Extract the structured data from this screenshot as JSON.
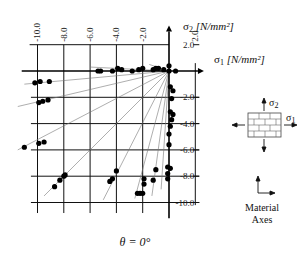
{
  "chart_data": {
    "type": "scatter",
    "title": "θ = 0°",
    "xlabel": "σ1 [N/mm²]",
    "ylabel": "σ2 [N/mm²]",
    "xlim": [
      -10.0,
      2.0
    ],
    "ylim": [
      -10.0,
      2.0
    ],
    "x_ticks": [
      "-10.0",
      "-8.0",
      "-6.0",
      "-4.0",
      "-2.0",
      "2.0"
    ],
    "y_ticks": [
      "2.0",
      "-2.0",
      "-4.0",
      "-6.0",
      "-8.0",
      "-10.0"
    ],
    "grid": true,
    "legend": {
      "position": "right",
      "stress_arrows": [
        "σ2",
        "σ1"
      ],
      "caption": [
        "Material",
        "Axes"
      ]
    },
    "series": [
      {
        "name": "experimental failure points",
        "points": [
          [
            -10.2,
            -0.9
          ],
          [
            -9.8,
            -0.8
          ],
          [
            -9.1,
            -0.8
          ],
          [
            -9.9,
            -2.4
          ],
          [
            -9.6,
            -2.3
          ],
          [
            -9.2,
            -2.2
          ],
          [
            -11.0,
            -5.8
          ],
          [
            -9.9,
            -5.5
          ],
          [
            -9.5,
            -5.4
          ],
          [
            -8.7,
            -8.8
          ],
          [
            -8.3,
            -8.3
          ],
          [
            -8.0,
            -8.0
          ],
          [
            -7.9,
            -7.9
          ],
          [
            -4.5,
            -8.4
          ],
          [
            -4.3,
            -8.2
          ],
          [
            -4.0,
            -7.6
          ],
          [
            -2.4,
            -9.3
          ],
          [
            -2.2,
            -9.3
          ],
          [
            -2.0,
            -9.3
          ],
          [
            -1.9,
            -8.6
          ],
          [
            -1.9,
            -8.2
          ],
          [
            -1.2,
            -8.3
          ],
          [
            -1.0,
            -7.5
          ],
          [
            -0.1,
            -8.2
          ],
          [
            -0.1,
            -7.8
          ],
          [
            -0.1,
            -7.3
          ],
          [
            0.1,
            -7.4
          ],
          [
            0.0,
            -5.6
          ],
          [
            0.0,
            -4.8
          ],
          [
            0.1,
            -4.2
          ],
          [
            0.2,
            -3.7
          ],
          [
            0.3,
            -3.3
          ],
          [
            0.1,
            -3.1
          ],
          [
            0.2,
            -2.1
          ],
          [
            0.3,
            -1.5
          ],
          [
            0.1,
            -1.2
          ],
          [
            0.0,
            0.0
          ],
          [
            0.0,
            0.4
          ],
          [
            0.5,
            0.0
          ],
          [
            -0.4,
            0.1
          ],
          [
            -0.8,
            0.2
          ],
          [
            -1.0,
            0.2
          ],
          [
            -1.2,
            0.1
          ],
          [
            -2.0,
            0.2
          ],
          [
            -2.3,
            0.1
          ],
          [
            -2.8,
            0.0
          ],
          [
            -3.6,
            0.1
          ],
          [
            -3.9,
            0.2
          ],
          [
            -4.3,
            0.0
          ],
          [
            -5.2,
            0.0
          ],
          [
            -5.4,
            0.0
          ]
        ]
      },
      {
        "name": "constant stress-ratio loading paths",
        "type": "line",
        "rays_through_origin_to": [
          [
            -11.0,
            -1.0
          ],
          [
            -11.5,
            -2.7
          ],
          [
            -11.5,
            -6.0
          ],
          [
            -9.5,
            -9.5
          ],
          [
            -5.0,
            -9.8
          ],
          [
            -2.6,
            -9.7
          ],
          [
            -1.3,
            -9.5
          ],
          [
            -0.6,
            -9.0
          ],
          [
            -6.0,
            0.3
          ],
          [
            -1.5,
            0.5
          ]
        ]
      }
    ]
  }
}
